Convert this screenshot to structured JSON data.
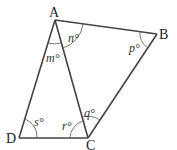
{
  "diagram": {
    "type": "quadrilateral with diagonal",
    "vertices": {
      "A": {
        "label": "A",
        "x": 55,
        "y": 20
      },
      "B": {
        "label": "B",
        "x": 157,
        "y": 34
      },
      "C": {
        "label": "C",
        "x": 88,
        "y": 138
      },
      "D": {
        "label": "D",
        "x": 19,
        "y": 138
      }
    },
    "edges": [
      "AB",
      "BC",
      "CD",
      "DA",
      "AC"
    ],
    "angles": {
      "n": {
        "label": "n°",
        "at": "A",
        "between": "AC-AB"
      },
      "m": {
        "label": "m°",
        "at": "A",
        "between": "AD-AC"
      },
      "p": {
        "label": "p°",
        "at": "B"
      },
      "q": {
        "label": "q°",
        "at": "C",
        "between": "CA-CB"
      },
      "r": {
        "label": "r°",
        "at": "C",
        "between": "CD-CA"
      },
      "s": {
        "label": "s°",
        "at": "D"
      }
    },
    "colors": {
      "line": "#444444",
      "text": "#222222"
    }
  }
}
